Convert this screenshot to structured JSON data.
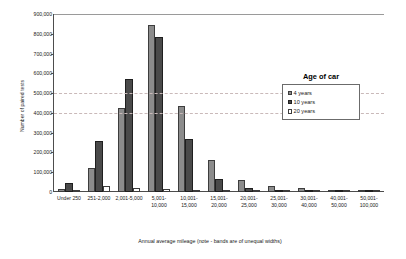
{
  "chart_data": {
    "type": "bar",
    "title": "",
    "xlabel": "Annual average mileage (note - bands are of unequal widths)",
    "ylabel": "Number of paired tests",
    "ylim": [
      0,
      900000
    ],
    "ytick_step": 100000,
    "ytick_labels": [
      "900,000",
      "800,000",
      "700,000",
      "600,000",
      "500,000",
      "400,000",
      "300,000",
      "200,000",
      "100,000",
      "0"
    ],
    "grid": "horizontal-dashed",
    "legend_position": "top-right",
    "legend_title": "Age of car",
    "categories": [
      "Under 250",
      "251-2,000",
      "2,001-5,000",
      "5,001-10,000",
      "10,001-15,000",
      "15,001-20,000",
      "20,001-25,000",
      "25,001-30,000",
      "30,001-40,000",
      "40,001-50,000",
      "50,001-100,000"
    ],
    "category_lines": [
      [
        "Under 250"
      ],
      [
        "251-2,000"
      ],
      [
        "2,001-5,000"
      ],
      [
        "5,001-",
        "10,000"
      ],
      [
        "10,001-",
        "15,000"
      ],
      [
        "15,001-",
        "20,000"
      ],
      [
        "20,001-",
        "25,000"
      ],
      [
        "25,001-",
        "30,000"
      ],
      [
        "30,001-",
        "40,000"
      ],
      [
        "40,001-",
        "50,000"
      ],
      [
        "50,001-",
        "100,000"
      ]
    ],
    "series": [
      {
        "name": "4 years",
        "color": "#8c8c8c",
        "values": [
          15000,
          122000,
          425000,
          845000,
          435000,
          163000,
          62000,
          28000,
          20000,
          6000,
          5000
        ]
      },
      {
        "name": "10 years",
        "color": "#4a4a4a",
        "values": [
          48000,
          258000,
          572000,
          782000,
          270000,
          68000,
          20000,
          8000,
          5000,
          2000,
          5000
        ]
      },
      {
        "name": "20 years",
        "color": "#ffffff",
        "values": [
          8000,
          28000,
          22000,
          14000,
          5000,
          2000,
          1000,
          500,
          400,
          200,
          200
        ]
      }
    ]
  }
}
